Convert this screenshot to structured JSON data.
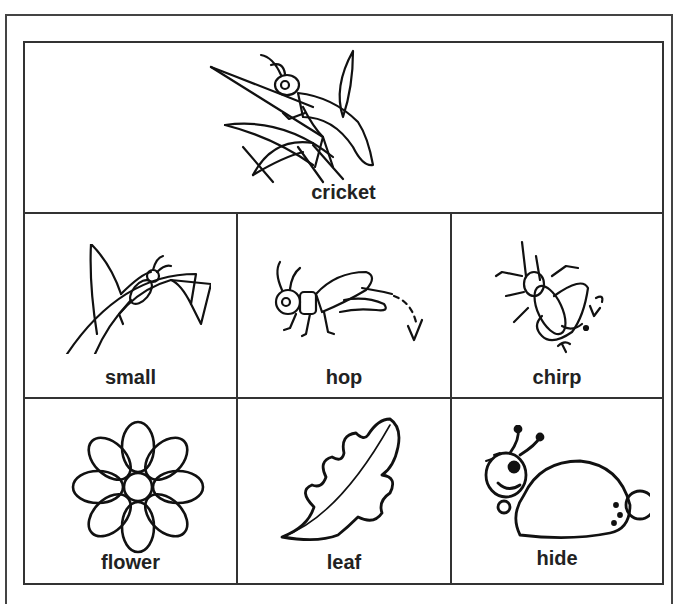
{
  "worksheet": {
    "header_card": {
      "label": "cricket",
      "icon": "cricket-on-grass-icon"
    },
    "cards": [
      {
        "label": "small",
        "icon": "small-cricket-on-grass-icon"
      },
      {
        "label": "hop",
        "icon": "hopping-cricket-icon"
      },
      {
        "label": "chirp",
        "icon": "chirping-cricket-icon"
      },
      {
        "label": "flower",
        "icon": "flower-icon"
      },
      {
        "label": "leaf",
        "icon": "oak-leaf-icon"
      },
      {
        "label": "hide",
        "icon": "hiding-bug-icon"
      }
    ],
    "colors": {
      "line": "#333333",
      "background": "#ffffff",
      "text": "#222222"
    }
  }
}
